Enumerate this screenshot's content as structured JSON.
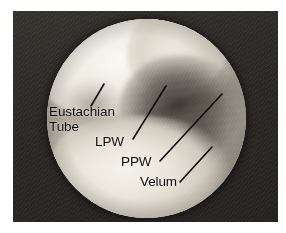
{
  "figure": {
    "kind": "endoscopic-photograph",
    "view": "nasopharyngoscopy",
    "panel": {
      "background_color": "#2a2724",
      "scope_field_shape": "circle"
    },
    "colors": {
      "panel_dark": "#2a2724",
      "tissue_light": "#f2efe8",
      "tissue_mid": "#c9c2b6",
      "shadow_dark": "#2a2622",
      "annotation": "#0b0b0b"
    }
  },
  "annotations": {
    "labels": [
      {
        "id": "eustachian-tube",
        "line1": "Eustachian",
        "line2": "Tube"
      },
      {
        "id": "lpw",
        "text": "LPW"
      },
      {
        "id": "ppw",
        "text": "PPW"
      },
      {
        "id": "velum",
        "text": "Velum"
      }
    ],
    "leader_lines": [
      {
        "id": "eustachian-tube-leader",
        "x1": 91,
        "y1": 106,
        "x2": 104,
        "y2": 84
      },
      {
        "id": "lpw-leader",
        "x1": 133,
        "y1": 139,
        "x2": 166,
        "y2": 86
      },
      {
        "id": "ppw-leader",
        "x1": 160,
        "y1": 161,
        "x2": 222,
        "y2": 94
      },
      {
        "id": "velum-leader",
        "x1": 180,
        "y1": 182,
        "x2": 212,
        "y2": 147
      }
    ]
  }
}
